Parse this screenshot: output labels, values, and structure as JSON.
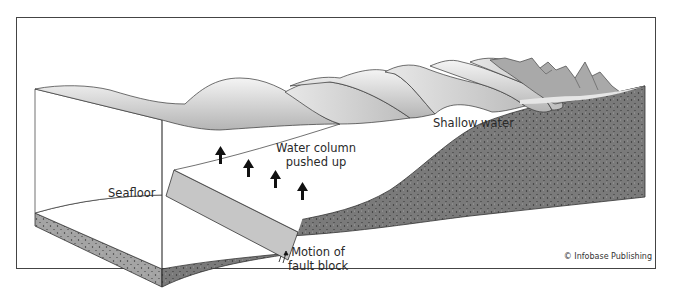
{
  "figure": {
    "type": "block diagram",
    "labels": {
      "seafloor": "Seafloor",
      "water_column_line1": "Water column",
      "water_column_line2": "pushed up",
      "shallow_water": "Shallow water",
      "fault_motion_line1": "Motion of",
      "fault_motion_line2": "fault block"
    },
    "credit": "© Infobase Publishing",
    "arrows": {
      "count": 4,
      "direction": "up",
      "meaning": "water column pushed up"
    },
    "colors": {
      "frame": "#444444",
      "ground": "#6e6e6e",
      "ground_dots": "#2b2b2b",
      "slab_left": "#9a9a9a",
      "fault_block": "#c8c8c8",
      "wave_shade": "#bdbdbd",
      "mountains": "#a9a9a9",
      "arrow": "#111111"
    }
  }
}
